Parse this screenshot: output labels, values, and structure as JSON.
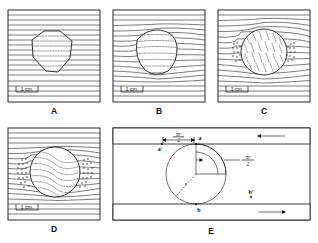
{
  "figure": {
    "caption_letters": [
      "A",
      "B",
      "C",
      "D",
      "E"
    ],
    "scale_label": "1 cm.",
    "panels": [
      {
        "id": "A",
        "letter": "A",
        "description": "Undeformed straight flow lines with hexagonal inclusion",
        "inclusion_shape": "hexagon",
        "has_scale_bar": true,
        "scale_label": "1 cm.",
        "flow_line_count": 17,
        "deflection": "none"
      },
      {
        "id": "B",
        "letter": "B",
        "description": "Slightly deflected flow lines around rounded inclusion",
        "inclusion_shape": "rounded-polygon",
        "has_scale_bar": true,
        "scale_label": "1 cm.",
        "flow_line_count": 17,
        "deflection": "slight"
      },
      {
        "id": "C",
        "letter": "C",
        "description": "Strongly deflected flow lines around circular inclusion with lateral fragment clusters",
        "inclusion_shape": "circle",
        "has_scale_bar": true,
        "scale_label": "1 cm.",
        "flow_line_count": 17,
        "deflection": "strong"
      },
      {
        "id": "D",
        "letter": "D",
        "description": "Fully developed deflection with pressure-shadow dot clusters on both sides of circle",
        "inclusion_shape": "circle",
        "has_scale_bar": true,
        "scale_label": "1 cm.",
        "flow_line_count": 17,
        "deflection": "maximum"
      },
      {
        "id": "E",
        "letter": "E",
        "description": "Geometric construction: circle between two hatched boundary bands with arc-length annotations",
        "has_scale_bar": false,
        "labels": {
          "arc_top": "πr",
          "arc_top_denom": "2",
          "arc_right": "πr",
          "arc_right_denom": "2",
          "radius": "r",
          "point_a": "a",
          "point_a_prime": "a'",
          "point_b": "b",
          "point_b_prime": "b'"
        }
      }
    ]
  },
  "colors": {
    "ink": "#111111",
    "paper": "#ffffff",
    "dash_ink": "#333333"
  }
}
